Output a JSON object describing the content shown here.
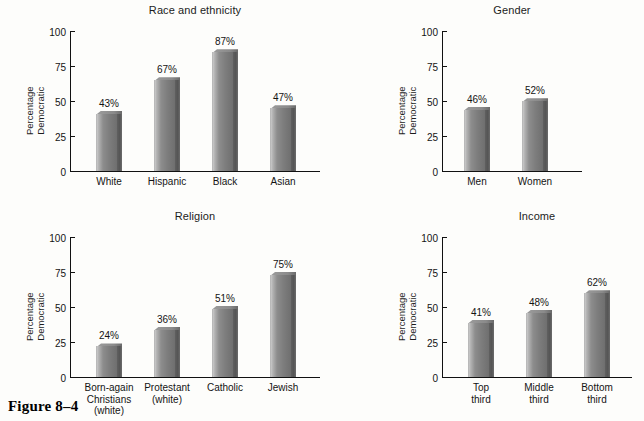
{
  "figure": {
    "caption": "Figure 8–4"
  },
  "axis": {
    "ylabel_line1": "Percentage",
    "ylabel_line2": "Democratic",
    "ticks": [
      "0",
      "25",
      "50",
      "75",
      "100"
    ],
    "ymin": 0,
    "ymax": 100
  },
  "chart_data": [
    {
      "type": "bar",
      "title": "Race and ethnicity",
      "xlabel": "",
      "ylabel": "Percentage Democratic",
      "ylim": [
        0,
        100
      ],
      "yticks": [
        0,
        25,
        50,
        75,
        100
      ],
      "grid": false,
      "legend": "none",
      "categories": [
        "White",
        "Hispanic",
        "Black",
        "Asian"
      ],
      "category_lines": [
        [
          "White"
        ],
        [
          "Hispanic"
        ],
        [
          "Black"
        ],
        [
          "Asian"
        ]
      ],
      "values": [
        43,
        67,
        87,
        47
      ],
      "data_labels": [
        "43%",
        "67%",
        "87%",
        "47%"
      ]
    },
    {
      "type": "bar",
      "title": "Gender",
      "xlabel": "",
      "ylabel": "Percentage Democratic",
      "ylim": [
        0,
        100
      ],
      "yticks": [
        0,
        25,
        50,
        75,
        100
      ],
      "grid": false,
      "legend": "none",
      "categories": [
        "Men",
        "Women"
      ],
      "category_lines": [
        [
          "Men"
        ],
        [
          "Women"
        ]
      ],
      "values": [
        46,
        52
      ],
      "data_labels": [
        "46%",
        "52%"
      ]
    },
    {
      "type": "bar",
      "title": "Religion",
      "xlabel": "",
      "ylabel": "Percentage Democratic",
      "ylim": [
        0,
        100
      ],
      "yticks": [
        0,
        25,
        50,
        75,
        100
      ],
      "grid": false,
      "legend": "none",
      "categories": [
        "Born-again Christians (white)",
        "Protestant (white)",
        "Catholic",
        "Jewish"
      ],
      "category_lines": [
        [
          "Born-again",
          "Christians",
          "(white)"
        ],
        [
          "Protestant",
          "(white)"
        ],
        [
          "Catholic"
        ],
        [
          "Jewish"
        ]
      ],
      "values": [
        24,
        36,
        51,
        75
      ],
      "data_labels": [
        "24%",
        "36%",
        "51%",
        "75%"
      ]
    },
    {
      "type": "bar",
      "title": "Income",
      "xlabel": "",
      "ylabel": "Percentage Democratic",
      "ylim": [
        0,
        100
      ],
      "yticks": [
        0,
        25,
        50,
        75,
        100
      ],
      "grid": false,
      "legend": "none",
      "categories": [
        "Top third",
        "Middle third",
        "Bottom third"
      ],
      "category_lines": [
        [
          "Top",
          "third"
        ],
        [
          "Middle",
          "third"
        ],
        [
          "Bottom",
          "third"
        ]
      ],
      "values": [
        41,
        48,
        62
      ],
      "data_labels": [
        "41%",
        "48%",
        "62%"
      ]
    }
  ],
  "colors": {
    "bar_light": "#c9c9c9",
    "bar_mid": "#8d8d8d",
    "bar_dark": "#6f6f6f",
    "bar_side": "#555555",
    "axis": "#111111",
    "text": "#141414",
    "background": "#fdfdfb"
  },
  "layout": {
    "panels": [
      {
        "key": "race",
        "left": 8,
        "top": 4,
        "plot_left": 62,
        "plot_top": 27,
        "plot_w": 250,
        "plot_h": 140,
        "title_left": 62,
        "title_w": 250,
        "bar_w": 26,
        "bar_gap_first": 26,
        "bar_pitch": 58
      },
      {
        "key": "gender",
        "left": 390,
        "top": 4,
        "plot_left": 52,
        "plot_top": 27,
        "plot_w": 140,
        "plot_h": 140,
        "title_left": 52,
        "title_w": 140,
        "bar_w": 26,
        "bar_gap_first": 22,
        "bar_pitch": 58
      },
      {
        "key": "religion",
        "left": 8,
        "top": 210,
        "plot_left": 62,
        "plot_top": 27,
        "plot_w": 250,
        "plot_h": 140,
        "title_left": 62,
        "title_w": 250,
        "bar_w": 26,
        "bar_gap_first": 26,
        "bar_pitch": 58
      },
      {
        "key": "income",
        "left": 390,
        "top": 210,
        "plot_left": 52,
        "plot_top": 27,
        "plot_w": 190,
        "plot_h": 140,
        "title_left": 52,
        "title_w": 190,
        "bar_w": 26,
        "bar_gap_first": 26,
        "bar_pitch": 58
      }
    ]
  }
}
